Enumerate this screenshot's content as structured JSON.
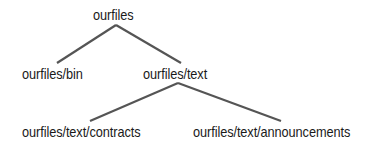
{
  "diagram": {
    "type": "directory-tree",
    "line_color": "#555555",
    "nodes": {
      "root": "ourfiles",
      "bin": "ourfiles/bin",
      "text": "ourfiles/text",
      "contracts": "ourfiles/text/contracts",
      "announcements": "ourfiles/text/announcements"
    },
    "edges": [
      {
        "from": "ourfiles",
        "to": "ourfiles/bin"
      },
      {
        "from": "ourfiles",
        "to": "ourfiles/text"
      },
      {
        "from": "ourfiles/text",
        "to": "ourfiles/text/contracts"
      },
      {
        "from": "ourfiles/text",
        "to": "ourfiles/text/announcements"
      }
    ]
  }
}
